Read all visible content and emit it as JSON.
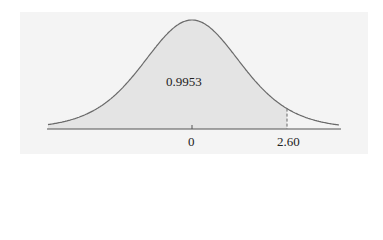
{
  "chart_data": {
    "type": "area",
    "title": "",
    "xlabel": "",
    "ylabel": "",
    "tick_labels": [
      "0",
      "2.60"
    ],
    "ticks": [
      0,
      2.6
    ],
    "shaded_region": {
      "from": "-inf",
      "to": 2.6
    },
    "shaded_area_label": "0.9953",
    "cutoff_value": 2.6,
    "cutoff_line_style": "dashed",
    "xlim": [
      -3.94,
      4.05
    ],
    "grid": false,
    "legend": "none"
  },
  "labels": {
    "area": "0.9953",
    "tick_zero": "0",
    "tick_cutoff": "2.60"
  },
  "colors": {
    "background": "#f4f4f4",
    "shade": "#e4e4e4",
    "curve": "#6a6a6a",
    "axis": "#555555",
    "dashed": "#666666"
  }
}
